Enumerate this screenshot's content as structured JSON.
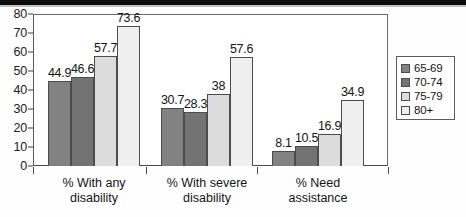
{
  "chart_data": {
    "type": "bar",
    "title": "",
    "xlabel": "",
    "ylabel": "",
    "ylim": [
      0,
      80
    ],
    "yticks": [
      0,
      10,
      20,
      30,
      40,
      50,
      60,
      70,
      80
    ],
    "grid": false,
    "legend_position": "right",
    "categories": [
      "% With any disability",
      "% With severe disability",
      "% Need assistance"
    ],
    "category_lines": [
      [
        "% With any",
        "disability"
      ],
      [
        "% With severe",
        "disability"
      ],
      [
        "% Need",
        "assistance"
      ]
    ],
    "series": [
      {
        "name": "65-69",
        "color": "#828282",
        "values": [
          44.9,
          30.7,
          8.1
        ],
        "labels": [
          "44.9",
          "30.7",
          "8.1"
        ]
      },
      {
        "name": "70-74",
        "color": "#737373",
        "values": [
          46.6,
          28.3,
          10.5
        ],
        "labels": [
          "46.6",
          "28.3",
          "10.5"
        ]
      },
      {
        "name": "75-79",
        "color": "#dcdcdc",
        "values": [
          57.7,
          38.0,
          16.9
        ],
        "labels": [
          "57.7",
          "38",
          "16.9"
        ]
      },
      {
        "name": "80+",
        "color": "#efefef",
        "values": [
          73.6,
          57.6,
          34.9
        ],
        "labels": [
          "73.6",
          "57.6",
          "34.9"
        ]
      }
    ]
  },
  "legend": {
    "items": [
      {
        "label": "65-69",
        "color": "#828282"
      },
      {
        "label": "70-74",
        "color": "#737373"
      },
      {
        "label": "75-79",
        "color": "#dcdcdc"
      },
      {
        "label": "80+",
        "color": "#efefef"
      }
    ]
  }
}
